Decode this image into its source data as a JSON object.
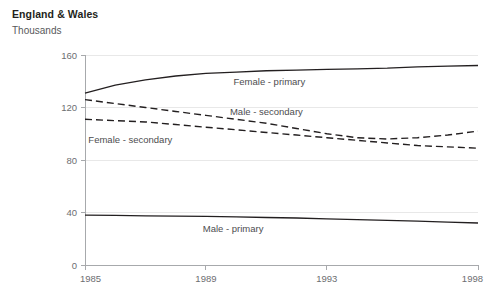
{
  "header": {
    "title": "England & Wales",
    "unit": "Thousands"
  },
  "chart_data": {
    "type": "line",
    "title": "England & Wales",
    "subtitle": "Thousands",
    "xlabel": "",
    "ylabel": "Thousands",
    "xlim": [
      1985,
      1998
    ],
    "ylim": [
      0,
      160
    ],
    "yticks": [
      0,
      40,
      80,
      120,
      160
    ],
    "xticks": [
      1985,
      1989,
      1993,
      1998
    ],
    "xtick_labels": [
      "1985",
      "1989",
      "1993",
      "1998"
    ],
    "ytick_labels": [
      "0",
      "40",
      "80",
      "120",
      "160"
    ],
    "grid": "horizontal-faint",
    "legend": "inline-labels",
    "x": [
      1985,
      1986,
      1987,
      1988,
      1989,
      1990,
      1991,
      1992,
      1993,
      1994,
      1995,
      1996,
      1997,
      1998
    ],
    "series": [
      {
        "name": "Female - primary",
        "style": "solid",
        "color": "#231f20",
        "label": "Female - primary",
        "label_x": 1991.1,
        "label_y": 137,
        "values": [
          131,
          137,
          141,
          144,
          146,
          147,
          148,
          148.5,
          149,
          149.5,
          150,
          151,
          151.5,
          152
        ]
      },
      {
        "name": "Male - secondary",
        "style": "dashed",
        "color": "#231f20",
        "label": "Male - secondary",
        "label_x": 1991.0,
        "label_y": 114,
        "values": [
          126,
          123,
          120,
          117,
          114,
          111,
          108,
          104,
          100,
          97,
          96,
          97,
          99,
          102
        ]
      },
      {
        "name": "Female - secondary",
        "style": "dashed",
        "color": "#231f20",
        "label": "Female - secondary",
        "label_x": 1986.5,
        "label_y": 93,
        "values": [
          111,
          110,
          109,
          107,
          105,
          103,
          101,
          99,
          97,
          95,
          93,
          91,
          90,
          89
        ]
      },
      {
        "name": "Male - primary",
        "style": "solid",
        "color": "#231f20",
        "label": "Male - primary",
        "label_x": 1989.9,
        "label_y": 25,
        "values": [
          38,
          37.8,
          37.5,
          37.2,
          37,
          36.6,
          36.2,
          35.8,
          35.2,
          34.6,
          34,
          33.4,
          32.7,
          32
        ]
      }
    ]
  }
}
